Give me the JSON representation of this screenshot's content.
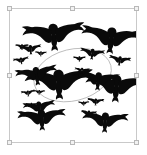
{
  "canvas": {
    "width": 147,
    "height": 155,
    "background_color": "#ffffff"
  },
  "selection": {
    "state_label": "selected",
    "frame": {
      "x": 9,
      "y": 8,
      "width": 128,
      "height": 135
    },
    "border_color": "#c9c9c9",
    "handle_fill": "#f2f2f2",
    "handle_border": "#b8b8b8",
    "handles": [
      {
        "name": "handle-top-left",
        "position": "nw"
      },
      {
        "name": "handle-top-center",
        "position": "n"
      },
      {
        "name": "handle-top-right",
        "position": "ne"
      },
      {
        "name": "handle-middle-left",
        "position": "w"
      },
      {
        "name": "handle-middle-right",
        "position": "e"
      },
      {
        "name": "handle-bottom-left",
        "position": "sw"
      },
      {
        "name": "handle-bottom-center",
        "position": "s"
      },
      {
        "name": "handle-bottom-right",
        "position": "se"
      }
    ]
  },
  "artwork": {
    "title": "Flock of birds in flight",
    "silhouette_color": "#0a0a0a",
    "background_color": "#ffffff",
    "orbit": {
      "label": "elliptical flight path",
      "stroke_color": "#b0b0b0",
      "stroke_width": 0.9,
      "cx": 73,
      "cy": 77,
      "rx": 46,
      "ry": 30,
      "rotation_deg": -14
    },
    "bird_count": 22,
    "birds": [
      {
        "id": 1,
        "cx": 51,
        "cy": 31,
        "scale": 1.55,
        "rot": -4,
        "size": "large"
      },
      {
        "id": 2,
        "cx": 118,
        "cy": 35,
        "scale": 1.5,
        "rot": 6,
        "size": "large"
      },
      {
        "id": 3,
        "cx": 57,
        "cy": 86,
        "scale": 1.7,
        "rot": -2,
        "size": "large"
      },
      {
        "id": 4,
        "cx": 124,
        "cy": 91,
        "scale": 1.55,
        "rot": 4,
        "size": "large"
      },
      {
        "id": 5,
        "cx": 31,
        "cy": 77,
        "scale": 1.05,
        "rot": -8,
        "size": "medium"
      },
      {
        "id": 6,
        "cx": 103,
        "cy": 83,
        "scale": 1.05,
        "rot": 5,
        "size": "medium"
      },
      {
        "id": 7,
        "cx": 37,
        "cy": 128,
        "scale": 1.2,
        "rot": -3,
        "size": "medium"
      },
      {
        "id": 8,
        "cx": 111,
        "cy": 131,
        "scale": 1.15,
        "rot": 3,
        "size": "medium"
      },
      {
        "id": 9,
        "cx": 34,
        "cy": 115,
        "scale": 0.8,
        "rot": -6,
        "size": "medium"
      },
      {
        "id": 10,
        "cx": 96,
        "cy": 52,
        "scale": 0.62,
        "rot": 7,
        "size": "small"
      },
      {
        "id": 11,
        "cx": 24,
        "cy": 47,
        "scale": 0.55,
        "rot": -5,
        "size": "small"
      },
      {
        "id": 12,
        "cx": 14,
        "cy": 44,
        "scale": 0.34,
        "rot": 0,
        "size": "tiny"
      },
      {
        "id": 13,
        "cx": 13,
        "cy": 60,
        "scale": 0.4,
        "rot": -9,
        "size": "tiny"
      },
      {
        "id": 14,
        "cx": 36,
        "cy": 52,
        "scale": 0.3,
        "rot": 3,
        "size": "tiny"
      },
      {
        "id": 15,
        "cx": 81,
        "cy": 58,
        "scale": 0.32,
        "rot": 0,
        "size": "tiny"
      },
      {
        "id": 16,
        "cx": 84,
        "cy": 72,
        "scale": 0.38,
        "rot": 5,
        "size": "tiny"
      },
      {
        "id": 17,
        "cx": 80,
        "cy": 78,
        "scale": 0.3,
        "rot": -4,
        "size": "tiny"
      },
      {
        "id": 18,
        "cx": 21,
        "cy": 98,
        "scale": 0.35,
        "rot": -7,
        "size": "tiny"
      },
      {
        "id": 19,
        "cx": 34,
        "cy": 97,
        "scale": 0.3,
        "rot": 2,
        "size": "tiny"
      },
      {
        "id": 20,
        "cx": 100,
        "cy": 108,
        "scale": 0.42,
        "rot": 4,
        "size": "tiny"
      },
      {
        "id": 21,
        "cx": 86,
        "cy": 110,
        "scale": 0.28,
        "rot": -2,
        "size": "tiny"
      },
      {
        "id": 22,
        "cx": 92,
        "cy": 122,
        "scale": 0.4,
        "rot": 6,
        "size": "tiny"
      },
      {
        "id": 23,
        "cx": 25,
        "cy": 112,
        "scale": 0.3,
        "rot": 0,
        "size": "tiny"
      },
      {
        "id": 24,
        "cx": 128,
        "cy": 60,
        "scale": 0.55,
        "rot": 8,
        "size": "small"
      }
    ]
  }
}
